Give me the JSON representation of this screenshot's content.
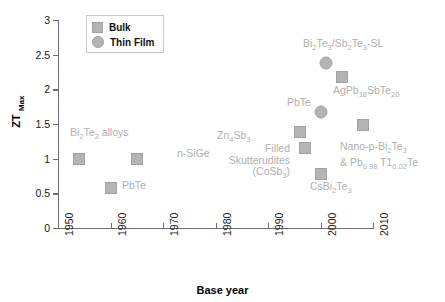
{
  "chart_data": {
    "type": "scatter",
    "title": "",
    "xlabel": "Base year",
    "ylabel": "ZT Max",
    "ylabel_main": "ZT",
    "ylabel_sub": "Max",
    "xlim": [
      1950,
      2010
    ],
    "ylim": [
      0,
      3
    ],
    "xticks": [
      1950,
      1960,
      1970,
      1980,
      1990,
      2000,
      2010
    ],
    "yticks": [
      0,
      0.5,
      1,
      1.5,
      2,
      2.5,
      3
    ],
    "ytick_labels": [
      "0",
      "0.5",
      "1",
      "1.5",
      "2",
      "2.5",
      "3"
    ],
    "xtick_labels": [
      "1950",
      "1960",
      "1970",
      "1980",
      "1990",
      "2000",
      "2010"
    ],
    "grid": false,
    "legend_position": "top-left",
    "legend": [
      {
        "name": "Bulk",
        "marker": "square"
      },
      {
        "name": "Thin Film",
        "marker": "circle"
      }
    ],
    "series": [
      {
        "name": "Bulk",
        "marker": "square",
        "points": [
          {
            "label": "Bi2Te3 alloys",
            "label_html": "Bi<sub>2</sub>Te<sub>3</sub> alloys",
            "x": 1954,
            "y": 1.0
          },
          {
            "label": "PbTe",
            "label_html": "PbTe",
            "x": 1960,
            "y": 0.58
          },
          {
            "label": "n-SiGe",
            "label_html": "n-SiGe",
            "x": 1965,
            "y": 1.0
          },
          {
            "label": "Zn4Sb3",
            "label_html": "Zn<sub>4</sub>Sb<sub>3</sub>",
            "x": 1996,
            "y": 1.38
          },
          {
            "label": "Filled Skutterudites (CoSb3)",
            "label_html": "Filled<br>Skutterudites<br>(CoSb<sub>3</sub>)",
            "x": 1997,
            "y": 1.16
          },
          {
            "label": "CsBi2Te3",
            "label_html": "CsBi<sub>2</sub>Te<sub>3</sub>",
            "x": 2000,
            "y": 0.78
          },
          {
            "label": "AgPb18SbTe20",
            "label_html": "AgPb<sub>18</sub>SbTe<sub>20</sub>",
            "x": 2004,
            "y": 2.18
          },
          {
            "label": "Nano-p-Bi2Te3 & Pb0.98 Tl0.02Te",
            "label_html": "Nano-p-Bi<sub>2</sub>Te<sub>3</sub><br>&amp; Pb<sub>0.98</sub> T1<sub>0.02</sub>Te",
            "x": 2008,
            "y": 1.48
          }
        ]
      },
      {
        "name": "Thin Film",
        "marker": "circle",
        "points": [
          {
            "label": "PbTe",
            "label_html": "PbTe",
            "x": 2000,
            "y": 1.68
          },
          {
            "label": "Bi2Te3/Sb2Te3-SL",
            "label_html": "Bi<sub>2</sub>Te<sub>3</sub>/Sb<sub>2</sub>Te<sub>3</sub>-SL",
            "x": 2001,
            "y": 2.38
          }
        ]
      }
    ],
    "colors": {
      "marker": "#b4b4b4",
      "marker_border": "#a2a2a2",
      "label_text": "#b0b0b0",
      "axis": "#6f6f6f",
      "axis_text": "#1a1a1a",
      "background": "#ffffff"
    }
  },
  "labels": {
    "bi2te3_alloys": "Bi2Te3 alloys",
    "pbte_bulk": "PbTe",
    "n_sige": "n-SiGe",
    "zn4sb3": "Zn4Sb3",
    "filled_skutterudites": "Filled Skutterudites (CoSb3)",
    "csbi2te3": "CsBi2Te3",
    "agpb18sbte20": "AgPb18SbTe20",
    "nano_p": "Nano-p-Bi2Te3 & Pb0.98 Tl0.02Te",
    "pbte_film": "PbTe",
    "superlattice": "Bi2Te3/Sb2Te3-SL"
  }
}
